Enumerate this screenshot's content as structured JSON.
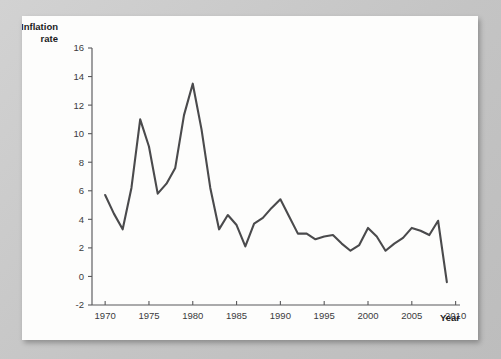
{
  "chart_data": {
    "type": "line",
    "title": "",
    "xlabel": "Year",
    "ylabel": "Inflation rate",
    "ylabel_lines": [
      "Inflation",
      "rate"
    ],
    "xlim": [
      1968.5,
      2010.5
    ],
    "ylim": [
      -2,
      16
    ],
    "grid": false,
    "legend": null,
    "x_ticks": [
      1970,
      1975,
      1980,
      1985,
      1990,
      1995,
      2000,
      2005,
      2010
    ],
    "x_tick_labels": [
      "1970",
      "1975",
      "1980",
      "1985",
      "1990",
      "1995",
      "2000",
      "2005",
      "2010"
    ],
    "y_ticks": [
      -2,
      0,
      2,
      4,
      6,
      8,
      10,
      12,
      14,
      16
    ],
    "y_tick_labels": [
      "-2",
      "0",
      "2",
      "4",
      "6",
      "8",
      "10",
      "12",
      "14",
      "16"
    ],
    "line_color": "#4a4a4c",
    "x": [
      1970,
      1971,
      1972,
      1973,
      1974,
      1975,
      1976,
      1977,
      1978,
      1979,
      1980,
      1981,
      1982,
      1983,
      1984,
      1985,
      1986,
      1987,
      1988,
      1989,
      1990,
      1991,
      1992,
      1993,
      1994,
      1995,
      1996,
      1997,
      1998,
      1999,
      2000,
      2001,
      2002,
      2003,
      2004,
      2005,
      2006,
      2007,
      2008,
      2009
    ],
    "values": [
      5.7,
      4.4,
      3.3,
      6.2,
      11.0,
      9.1,
      5.8,
      6.5,
      7.6,
      11.3,
      13.5,
      10.3,
      6.2,
      3.3,
      4.3,
      3.6,
      2.1,
      3.7,
      4.1,
      4.8,
      5.4,
      4.2,
      3.0,
      3.0,
      2.6,
      2.8,
      2.9,
      2.3,
      1.8,
      2.2,
      3.4,
      2.8,
      1.8,
      2.3,
      2.7,
      3.4,
      3.2,
      2.9,
      3.9,
      -0.4
    ],
    "last_point_label": "",
    "series_name": "Inflation rate"
  }
}
